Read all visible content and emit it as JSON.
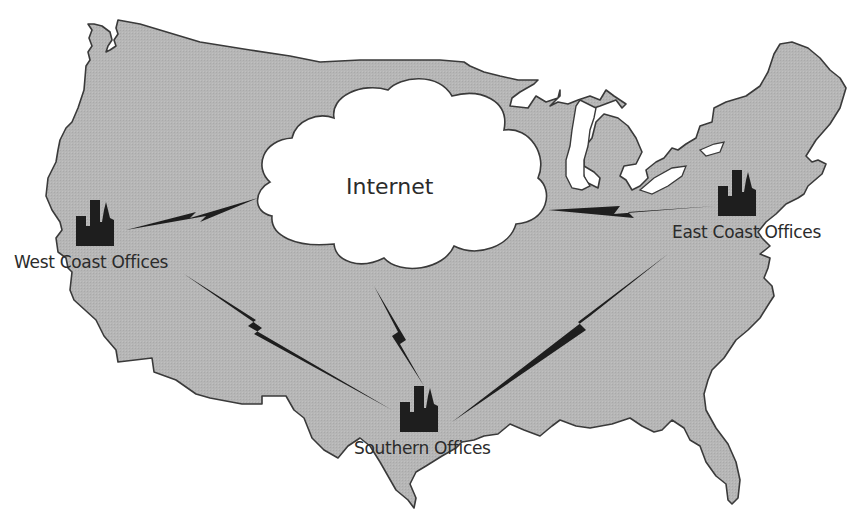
{
  "diagram": {
    "type": "network-map",
    "colors": {
      "land": "#b4b4b4",
      "outline": "#3a3a3a",
      "cloud": "#ffffff",
      "link": "#1e1e1e",
      "building": "#1e1e1e",
      "text": "#2b2b2b"
    },
    "cloud": {
      "label": "Internet",
      "icon": "cloud-icon"
    },
    "nodes": [
      {
        "id": "west",
        "label": "West Coast Offices",
        "icon": "office-buildings-icon"
      },
      {
        "id": "east",
        "label": "East Coast Offices",
        "icon": "office-buildings-icon"
      },
      {
        "id": "south",
        "label": "Southern Offices",
        "icon": "office-buildings-icon"
      }
    ],
    "links": [
      {
        "from": "west",
        "to": "internet",
        "style": "lightning-bolt"
      },
      {
        "from": "east",
        "to": "internet",
        "style": "lightning-bolt"
      },
      {
        "from": "south",
        "to": "internet",
        "style": "lightning-bolt"
      },
      {
        "from": "west",
        "to": "south",
        "style": "lightning-bolt"
      },
      {
        "from": "east",
        "to": "south",
        "style": "lightning-bolt"
      }
    ]
  }
}
